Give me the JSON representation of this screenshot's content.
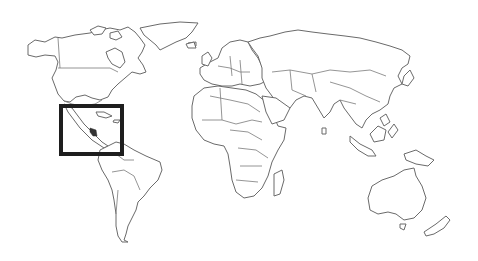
{
  "map": {
    "type": "world-outline-political",
    "background": "#ffffff",
    "line_color": "#6a6a6a",
    "focus_box": {
      "region": "Central America and Caribbean",
      "x": 61,
      "y": 106,
      "width": 61,
      "height": 48,
      "stroke_color": "#1e1e1e",
      "stroke_width": 4
    },
    "highlighted_country": {
      "region": "Nicaragua / Honduras area",
      "fill_color": "#333333"
    },
    "continents": [
      "North America",
      "Greenland",
      "South America",
      "Europe",
      "Africa",
      "Asia",
      "Australia",
      "New Zealand",
      "Madagascar"
    ]
  }
}
